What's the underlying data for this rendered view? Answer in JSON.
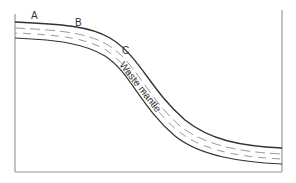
{
  "diagram": {
    "point_labels": [
      "A",
      "B",
      "C"
    ],
    "layer_label": "Waste mantle",
    "colors": {
      "line": "#333333",
      "dash": "#9a9a9a",
      "frame": "#999999",
      "background": "#ffffff"
    }
  }
}
